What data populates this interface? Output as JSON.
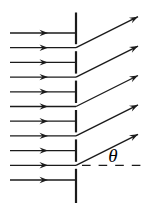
{
  "diagram": {
    "canvas": {
      "width": 143,
      "height": 212
    },
    "colors": {
      "ink": "#1b1b1b",
      "background": "#ffffff"
    },
    "barrier": {
      "x": 76,
      "stroke_width": 2.2,
      "segments": [
        [
          12.5,
          44.2
        ],
        [
          51.2,
          73.6
        ],
        [
          80.6,
          103.0
        ],
        [
          110.0,
          132.4
        ],
        [
          139.4,
          161.8
        ],
        [
          168.8,
          203.0
        ]
      ]
    },
    "incident_rays": {
      "x_start": 10,
      "x_end": 76,
      "arrowhead_x": 48,
      "stroke_width": 1.3,
      "y_values": [
        33.0,
        47.7,
        62.4,
        77.1,
        91.8,
        106.5,
        121.2,
        135.9,
        150.6,
        165.3,
        180.0
      ]
    },
    "refracted_rays": {
      "origin_x": 76,
      "dx": 62,
      "dy": -31,
      "stroke_width": 1.3,
      "origin_y_values": [
        47.7,
        77.1,
        106.5,
        135.9,
        165.3
      ]
    },
    "dashed_baseline": {
      "y": 165.3,
      "x1": 82,
      "x2": 141,
      "stroke_width": 1.3,
      "dash_pattern": "8.6 8"
    },
    "arrowhead": {
      "length": 8.5,
      "half_width": 3.2,
      "notch": 5.5
    },
    "angle_label": {
      "text": "θ",
      "x": 113,
      "y": 162
    }
  }
}
